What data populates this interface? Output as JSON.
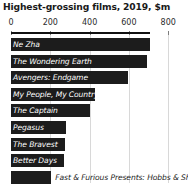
{
  "chart_data": {
    "type": "bar",
    "orientation": "horizontal",
    "title": "Highest-grossing films, 2019, $m",
    "xlabel": "",
    "ylabel": "",
    "xlim": [
      0,
      800
    ],
    "ticks": [
      0,
      200,
      400,
      600,
      800
    ],
    "tick_labels": [
      "0",
      "200",
      "400",
      "600",
      "800"
    ],
    "grid": true,
    "legend": "none",
    "bar_color": "#1c1c1c",
    "categories": [
      "Ne Zha",
      "The Wondering Earth",
      "Avengers: Endgame",
      "My People, My Country",
      "The Captain",
      "Pegasus",
      "The Bravest",
      "Better Days",
      "Fast & Furious Presents: Hobbs & Show"
    ],
    "values": [
      705,
      690,
      595,
      425,
      400,
      280,
      275,
      270,
      205
    ],
    "label_placement": [
      "inside",
      "inside",
      "inside",
      "inside",
      "inside",
      "inside",
      "inside",
      "inside",
      "outside"
    ]
  }
}
